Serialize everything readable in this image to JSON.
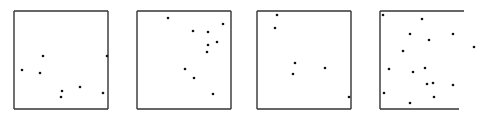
{
  "chart_data": [
    {
      "type": "scatter",
      "title": "",
      "xlabel": "",
      "ylabel": "",
      "grid": false,
      "legend": null,
      "frame": {
        "left": 14,
        "top": 11,
        "right": 108,
        "bottom": 109,
        "borders": [
          "top",
          "right",
          "bottom",
          "left"
        ]
      },
      "points_px": [
        [
          43,
          56
        ],
        [
          22,
          70
        ],
        [
          40,
          73
        ],
        [
          107,
          56
        ],
        [
          62,
          91
        ],
        [
          61,
          97
        ],
        [
          80,
          87
        ],
        [
          103,
          93
        ]
      ]
    },
    {
      "type": "scatter",
      "title": "",
      "xlabel": "",
      "ylabel": "",
      "grid": false,
      "legend": null,
      "frame": {
        "left": 137,
        "top": 11,
        "right": 231,
        "bottom": 109,
        "borders": [
          "top",
          "right",
          "bottom",
          "left"
        ]
      },
      "points_px": [
        [
          168,
          18
        ],
        [
          223,
          24
        ],
        [
          193,
          31
        ],
        [
          208,
          32
        ],
        [
          217,
          42
        ],
        [
          208,
          45
        ],
        [
          207,
          52
        ],
        [
          185,
          69
        ],
        [
          194,
          78
        ],
        [
          213,
          94
        ]
      ]
    },
    {
      "type": "scatter",
      "title": "",
      "xlabel": "",
      "ylabel": "",
      "grid": false,
      "legend": null,
      "frame": {
        "left": 257,
        "top": 11,
        "right": 351,
        "bottom": 109,
        "borders": [
          "top",
          "right",
          "bottom",
          "left"
        ]
      },
      "points_px": [
        [
          277,
          15
        ],
        [
          275,
          28
        ],
        [
          295,
          63
        ],
        [
          293,
          74
        ],
        [
          325,
          68
        ],
        [
          349,
          97
        ]
      ]
    },
    {
      "type": "scatter",
      "title": "",
      "xlabel": "",
      "ylabel": "",
      "grid": false,
      "legend": null,
      "frame": {
        "left": 380,
        "top": 11,
        "right": 464,
        "bottom": 109,
        "bottom_right": 459,
        "borders": [
          "top",
          "bottom",
          "left"
        ]
      },
      "points_px": [
        [
          383,
          15
        ],
        [
          422,
          19
        ],
        [
          410,
          34
        ],
        [
          429,
          40
        ],
        [
          453,
          34
        ],
        [
          403,
          51
        ],
        [
          474,
          47
        ],
        [
          389,
          69
        ],
        [
          413,
          72
        ],
        [
          425,
          68
        ],
        [
          427,
          84
        ],
        [
          433,
          83
        ],
        [
          453,
          85
        ],
        [
          384,
          93
        ],
        [
          434,
          97
        ],
        [
          410,
          103
        ]
      ]
    }
  ],
  "style": {
    "frame_color": "#333333",
    "point_color": "#111111",
    "background": "#ffffff"
  }
}
